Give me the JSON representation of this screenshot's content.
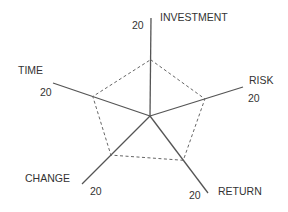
{
  "chart_data": {
    "type": "radar",
    "title": "",
    "axes": [
      "INVESTMENT",
      "RISK",
      "RETURN",
      "CHANGE",
      "TIME"
    ],
    "axis_max_label": "20",
    "range": [
      0,
      20
    ],
    "grid": false,
    "legend": null,
    "series": [
      {
        "name": "profile",
        "style": "dashed",
        "values": [
          11.5,
          11.8,
          11.5,
          11.5,
          11.8
        ]
      }
    ]
  },
  "labels": {
    "investment": "INVESTMENT",
    "risk": "RISK",
    "return": "RETURN",
    "change": "CHANGE",
    "time": "TIME",
    "max_investment": "20",
    "max_risk": "20",
    "max_return": "20",
    "max_change": "20",
    "max_time": "20"
  },
  "colors": {
    "axis": "#555555",
    "polygon": "#666666",
    "text": "#333333"
  }
}
